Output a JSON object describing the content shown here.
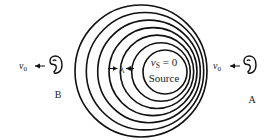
{
  "diagram": {
    "source": {
      "velocity_label_var": "v",
      "velocity_label_sub": "S",
      "velocity_label_rest": " = 0",
      "name": "Source"
    },
    "wavelength_label": "λ",
    "wavefronts": {
      "count": 7,
      "stroke_color": "#111111"
    },
    "observers": [
      {
        "id": "B",
        "label": "B",
        "velocity_var": "v",
        "velocity_sub": "0",
        "direction": "left",
        "side": "left"
      },
      {
        "id": "A",
        "label": "A",
        "velocity_var": "v",
        "velocity_sub": "0",
        "direction": "left",
        "side": "right"
      }
    ]
  }
}
